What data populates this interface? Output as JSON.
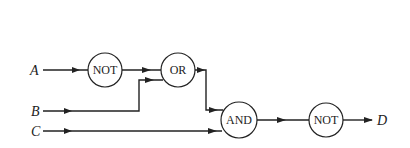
{
  "diagram": {
    "type": "logic-circuit",
    "inputs": [
      {
        "id": "A",
        "label": "A"
      },
      {
        "id": "B",
        "label": "B"
      },
      {
        "id": "C",
        "label": "C"
      }
    ],
    "output": {
      "id": "D",
      "label": "D"
    },
    "gates": [
      {
        "id": "not1",
        "label": "NOT",
        "inputs": [
          "A"
        ]
      },
      {
        "id": "or1",
        "label": "OR",
        "inputs": [
          "not1",
          "B"
        ]
      },
      {
        "id": "and1",
        "label": "AND",
        "inputs": [
          "or1",
          "C"
        ]
      },
      {
        "id": "not2",
        "label": "NOT",
        "inputs": [
          "and1"
        ]
      }
    ],
    "expression": "D = NOT((NOT A OR B) AND C)"
  }
}
